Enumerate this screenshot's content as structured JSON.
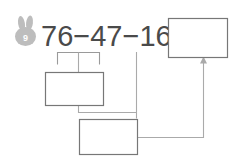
{
  "worksheet": {
    "problem_number": "9",
    "badge_icon": "bunny-icon",
    "equation": {
      "full_text": "76−47−16=",
      "operand_1": "76",
      "operator_1": "−",
      "operand_2": "47",
      "operator_2": "−",
      "operand_3": "16",
      "equals": "="
    },
    "answer_boxes": [
      {
        "id": "box-partial-left",
        "value": "",
        "placeholder": ""
      },
      {
        "id": "box-partial-bottom",
        "value": "",
        "placeholder": ""
      },
      {
        "id": "box-final-result",
        "value": "",
        "placeholder": ""
      }
    ],
    "colors": {
      "background": "#ffffff",
      "text": "#4a4a4a",
      "box_border": "#777777",
      "connector": "#aaaaaa",
      "badge": "#bdbdbd"
    }
  }
}
